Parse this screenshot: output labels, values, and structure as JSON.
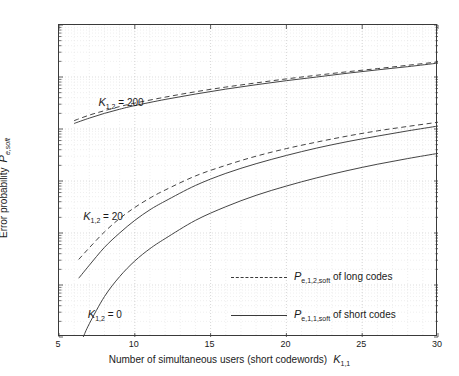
{
  "chart_data": {
    "type": "line",
    "title": "",
    "xlabel": "Number of simultaneous users  (short codewords)",
    "xlabel_symbol": "K",
    "xlabel_symbol_sub": "1,1",
    "ylabel": "Error probability",
    "ylabel_symbol": "P",
    "ylabel_symbol_sub": "e,soft",
    "xscale": "linear",
    "yscale": "log",
    "xlim": [
      5,
      30
    ],
    "ylim": [
      1e-07,
      0.1
    ],
    "xticks": [
      5,
      10,
      15,
      20,
      25,
      30
    ],
    "xticklabels": [
      "5",
      "10",
      "15",
      "20",
      "25",
      "30"
    ],
    "yticks": [
      1e-07,
      1e-06,
      1e-05,
      0.0001,
      0.001,
      0.01,
      0.1
    ],
    "yticklabels": [
      "10-7",
      "10-6",
      "10-5",
      "10-4",
      "10-3",
      "10-2",
      "10-1"
    ],
    "yticklabel_exponents": [
      "-7",
      "-6",
      "-5",
      "-4",
      "-3",
      "-2",
      "-1"
    ],
    "grid": true,
    "grid_minor": true,
    "legend_position": "lower right",
    "line_color": "#3a3a3a",
    "series": [
      {
        "name": "K_1,2 = 200, long codes (dashed)",
        "group": "K12_200",
        "style": "dashed",
        "x": [
          6.0,
          7,
          8,
          9,
          10,
          12,
          14,
          16,
          18,
          20,
          22,
          24,
          26,
          28,
          30
        ],
        "y": [
          0.00145,
          0.00185,
          0.00225,
          0.0027,
          0.00315,
          0.0041,
          0.0052,
          0.0064,
          0.0077,
          0.0092,
          0.0108,
          0.0126,
          0.0145,
          0.0168,
          0.0195
        ]
      },
      {
        "name": "K_1,2 = 200, short codes (solid)",
        "group": "K12_200",
        "style": "solid",
        "x": [
          6.0,
          7,
          8,
          9,
          10,
          12,
          14,
          16,
          18,
          20,
          22,
          24,
          26,
          28,
          30
        ],
        "y": [
          0.00128,
          0.00162,
          0.002,
          0.0024,
          0.00282,
          0.0037,
          0.0047,
          0.00585,
          0.0071,
          0.0085,
          0.01,
          0.0118,
          0.0137,
          0.0158,
          0.0185
        ]
      },
      {
        "name": "K_1,2 = 20, long codes (dashed)",
        "group": "K12_20",
        "style": "dashed",
        "x": [
          6.3,
          7,
          8,
          9,
          10,
          11,
          12,
          14,
          16,
          18,
          20,
          22,
          24,
          26,
          28,
          30
        ],
        "y": [
          3.1e-06,
          5.2e-06,
          1.05e-05,
          1.9e-05,
          3.1e-05,
          4.7e-05,
          6.7e-05,
          0.000125,
          0.0002,
          0.0003,
          0.00042,
          0.00056,
          0.00073,
          0.00092,
          0.00112,
          0.00135
        ]
      },
      {
        "name": "K_1,2 = 20, short codes (solid)",
        "group": "K12_20",
        "style": "solid",
        "x": [
          6.3,
          7,
          8,
          9,
          10,
          11,
          12,
          14,
          16,
          18,
          20,
          22,
          24,
          26,
          28,
          30
        ],
        "y": [
          1.35e-06,
          2.4e-06,
          5.3e-06,
          1e-05,
          1.75e-05,
          2.8e-05,
          4.1e-05,
          8.2e-05,
          0.00014,
          0.000215,
          0.00031,
          0.00043,
          0.00057,
          0.00073,
          0.00092,
          0.00114
        ]
      },
      {
        "name": "K_1,2 = 0, short codes (solid)",
        "group": "K12_0",
        "style": "solid",
        "x": [
          6.6,
          7,
          8,
          9,
          10,
          11,
          12,
          14,
          16,
          18,
          20,
          22,
          24,
          26,
          28,
          30
        ],
        "y": [
          1e-07,
          1.8e-07,
          6e-07,
          1.45e-06,
          2.9e-06,
          5e-06,
          7.8e-06,
          1.75e-05,
          3.2e-05,
          5.3e-05,
          8e-05,
          0.000115,
          0.000158,
          0.00021,
          0.00027,
          0.00034
        ]
      }
    ],
    "annotations": [
      {
        "symbol": "K",
        "sub": "1,2",
        "text": " = 200",
        "x_data": 7.6,
        "y_data": 0.0032
      },
      {
        "symbol": "K",
        "sub": "1,2",
        "text": " = 20",
        "x_data": 6.6,
        "y_data": 2e-05
      },
      {
        "symbol": "K",
        "sub": "1,2",
        "text": " = 0",
        "x_data": 6.9,
        "y_data": 2.6e-07
      }
    ],
    "legend": [
      {
        "style": "dashed",
        "symbol": "P",
        "sub": "e,1,2,soft",
        "text": " of long codes"
      },
      {
        "style": "solid",
        "symbol": "P",
        "sub": "e,1,1,soft",
        "text": " of short codes"
      }
    ]
  }
}
